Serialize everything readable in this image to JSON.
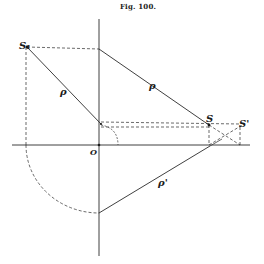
{
  "figure": {
    "title": "Fig. 100.",
    "labels": {
      "point_upper_left": "S₁",
      "origin": "O",
      "point_right": "S",
      "point_far_right": "S'",
      "rho_left": "ρ",
      "rho_upper": "ρ",
      "rho_lower": "ρ'"
    },
    "colors": {
      "ink": "#2a2a2a",
      "background": "#ffffff"
    }
  }
}
